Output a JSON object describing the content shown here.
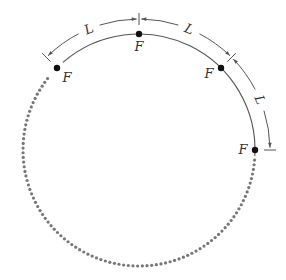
{
  "diagram": {
    "points": [
      {
        "label": "F",
        "angle_deg": 135
      },
      {
        "label": "F",
        "angle_deg": 90
      },
      {
        "label": "F",
        "angle_deg": 45
      },
      {
        "label": "F",
        "angle_deg": 0
      }
    ],
    "dimensions": [
      {
        "label": "L",
        "from_angle_deg": 135,
        "to_angle_deg": 90
      },
      {
        "label": "L",
        "from_angle_deg": 90,
        "to_angle_deg": 45
      },
      {
        "label": "L",
        "from_angle_deg": 45,
        "to_angle_deg": 0
      }
    ],
    "solid_arc": {
      "from_angle_deg": 135,
      "to_angle_deg": 0
    },
    "dotted_arc": {
      "from_angle_deg": 0,
      "to_angle_deg": -225
    },
    "colors": {
      "line": "#555555",
      "dots": "#777777",
      "point": "#111111",
      "text": "#333333"
    }
  }
}
